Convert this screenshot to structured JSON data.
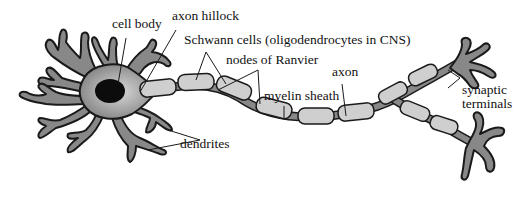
{
  "diagram": {
    "colors": {
      "cell_fill": "#8a8a8a",
      "cell_light": "#c9c9c9",
      "nucleus": "#0c0c0c",
      "myelin": "#cfcfcf",
      "outline": "#1a1a1a",
      "background": "#ffffff"
    },
    "labels": {
      "cell_body": "cell body",
      "axon_hillock": "axon hillock",
      "schwann_cells": "Schwann cells (oligodendrocytes in CNS)",
      "nodes_of_ranvier": "nodes of Ranvier",
      "myelin_sheath": "myelin sheath",
      "axon": "axon",
      "synaptic": "synaptic",
      "terminals": "terminals",
      "dendrites": "dendrites"
    }
  }
}
